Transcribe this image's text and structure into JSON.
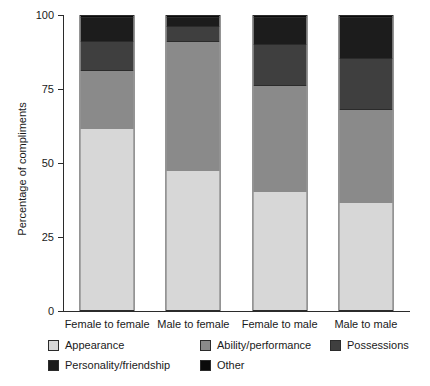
{
  "chart_data": {
    "type": "bar",
    "subtype": "stacked-bar-100",
    "title": "",
    "xlabel": "",
    "ylabel": "Percentage of compliments",
    "ylim": [
      0,
      100
    ],
    "yticks": [
      0,
      25,
      50,
      75,
      100
    ],
    "ytick_labels": [
      "0",
      "25",
      "50",
      "75",
      "100"
    ],
    "grid": false,
    "legend_position": "bottom",
    "categories": [
      "Female to female",
      "Male to female",
      "Female to male",
      "Male to male"
    ],
    "series": [
      {
        "name": "Appearance",
        "color": "#d7d7d7",
        "values": [
          61,
          47,
          40,
          36
        ]
      },
      {
        "name": "Ability/performance",
        "color": "#8a8a8a",
        "values": [
          20,
          44,
          36,
          32
        ]
      },
      {
        "name": "Possessions",
        "color": "#3f3f3f",
        "values": [
          10,
          5,
          14,
          17
        ]
      },
      {
        "name": "Personality/friendship",
        "color": "#1c1c1c",
        "values": [
          8,
          3,
          9,
          14
        ]
      },
      {
        "name": "Other",
        "color": "#0a0a0a",
        "values": [
          1,
          1,
          1,
          1
        ]
      }
    ]
  },
  "axis": {
    "y_title": "Percentage of compliments"
  },
  "legend": {
    "rows": [
      [
        {
          "label": "Appearance",
          "color": "#d7d7d7"
        },
        {
          "label": "Ability/performance",
          "color": "#8a8a8a"
        },
        {
          "label": "Possessions",
          "color": "#3f3f3f"
        }
      ],
      [
        {
          "label": "Personality/friendship",
          "color": "#1c1c1c"
        },
        {
          "label": "Other",
          "color": "#0a0a0a"
        }
      ]
    ]
  }
}
